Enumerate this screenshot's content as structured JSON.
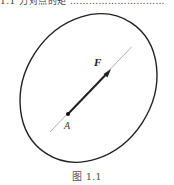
{
  "top_text_fragment": "1.1  力对点的矩 …………………………",
  "figure": {
    "force_label": "F",
    "point_label": "A",
    "caption": "图 1.1",
    "colors": {
      "ellipse": "#222222",
      "axis_line": "#9a9a9a",
      "force_vector": "#222222",
      "point": "#111111"
    }
  }
}
